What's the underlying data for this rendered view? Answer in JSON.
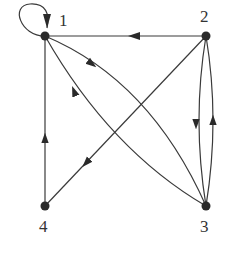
{
  "diagram": {
    "type": "directed-graph",
    "nodes": [
      {
        "id": "1",
        "label": "1"
      },
      {
        "id": "2",
        "label": "2"
      },
      {
        "id": "3",
        "label": "3"
      },
      {
        "id": "4",
        "label": "4"
      }
    ],
    "edges": [
      {
        "from": "1",
        "to": "1",
        "kind": "self-loop"
      },
      {
        "from": "2",
        "to": "1",
        "kind": "straight"
      },
      {
        "from": "1",
        "to": "3",
        "kind": "curved"
      },
      {
        "from": "3",
        "to": "1",
        "kind": "curved"
      },
      {
        "from": "2",
        "to": "4",
        "kind": "straight"
      },
      {
        "from": "4",
        "to": "1",
        "kind": "straight"
      },
      {
        "from": "2",
        "to": "3",
        "kind": "curved"
      },
      {
        "from": "3",
        "to": "2",
        "kind": "curved"
      }
    ]
  }
}
